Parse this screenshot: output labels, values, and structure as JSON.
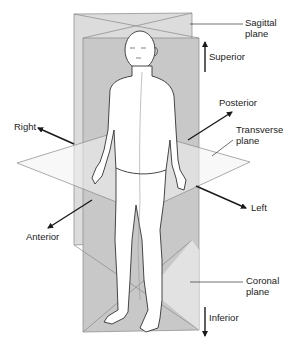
{
  "diagram": {
    "type": "anatomical-planes",
    "labels": {
      "sagittal_line1": "Sagittal",
      "sagittal_line2": "plane",
      "superior": "Superior",
      "posterior": "Posterior",
      "right": "Right",
      "transverse_line1": "Transverse",
      "transverse_line2": "plane",
      "left": "Left",
      "anterior": "Anterior",
      "coronal_line1": "Coronal",
      "coronal_line2": "plane",
      "inferior": "Inferior"
    },
    "colors": {
      "sagittal_plane": "#d9d9d9",
      "coronal_plane": "#c4c4c4",
      "transverse_plane": "#f4f4f4",
      "outline": "#777777",
      "body_fill": "#ffffff",
      "body_stroke": "#333333",
      "arrow": "#1a1a1a"
    }
  }
}
